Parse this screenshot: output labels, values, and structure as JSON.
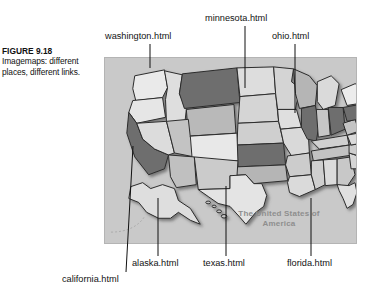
{
  "figure": {
    "number": "FIGURE 9.18",
    "caption": "Imagemaps: different places, different links."
  },
  "map": {
    "title_line1": "The United States of",
    "title_line2": "America",
    "background_color": "#c9c9c9",
    "border_color": "#b4b4b4",
    "highlight_color": "#6e6e6e",
    "state_light_color": "#e4e4e4",
    "state_mid_color": "#b9b9b9",
    "outline_color": "#2b2b2b"
  },
  "callouts": [
    {
      "id": "washington",
      "label": "washington.html",
      "position": "top"
    },
    {
      "id": "minnesota",
      "label": "minnesota.html",
      "position": "top"
    },
    {
      "id": "ohio",
      "label": "ohio.html",
      "position": "top"
    },
    {
      "id": "california",
      "label": "california.html",
      "position": "bottom"
    },
    {
      "id": "alaska",
      "label": "alaska.html",
      "position": "bottom"
    },
    {
      "id": "texas",
      "label": "texas.html",
      "position": "bottom"
    },
    {
      "id": "florida",
      "label": "florida.html",
      "position": "bottom"
    }
  ]
}
